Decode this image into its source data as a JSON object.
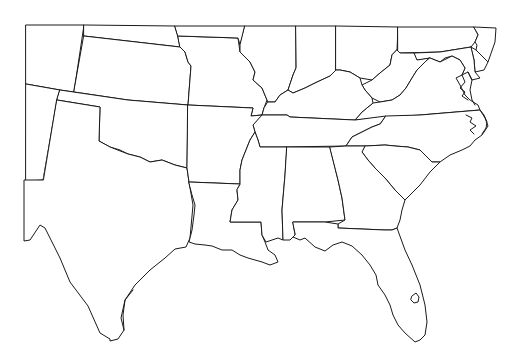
{
  "map": {
    "type": "outline",
    "region": "Southeastern United States",
    "labels_shown": false,
    "colors": {
      "background": "#ffffff",
      "stroke": "#1a1a1a",
      "fill": "#ffffff"
    },
    "states": [
      "Colorado",
      "Kansas",
      "Nebraska",
      "New Mexico",
      "Oklahoma",
      "Texas",
      "Missouri",
      "Iowa",
      "Illinois",
      "Indiana",
      "Ohio",
      "Pennsylvania",
      "New Jersey",
      "Delaware",
      "Maryland",
      "West Virginia",
      "Virginia",
      "Kentucky",
      "Tennessee",
      "North Carolina",
      "South Carolina",
      "Arkansas",
      "Louisiana",
      "Mississippi",
      "Alabama",
      "Georgia",
      "Florida"
    ]
  }
}
